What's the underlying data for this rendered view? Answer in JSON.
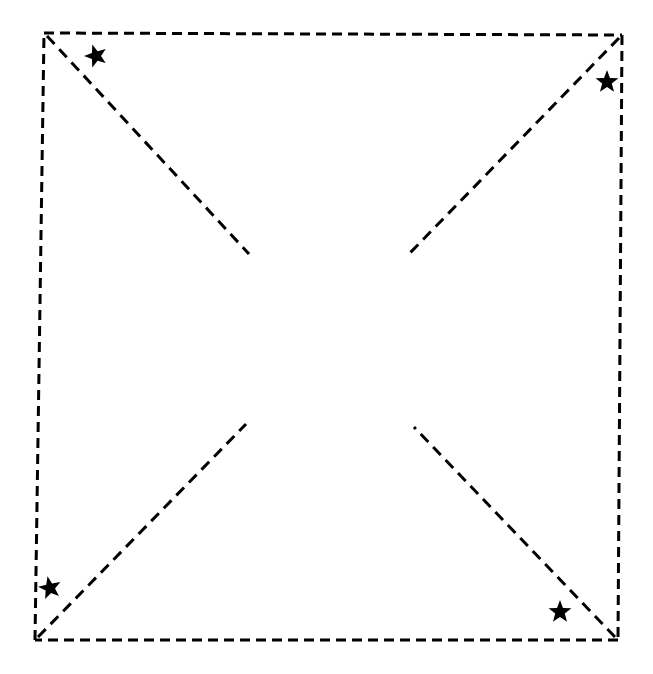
{
  "figure": {
    "canvas": {
      "width": 653,
      "height": 674
    },
    "background_color": "#ffffff",
    "stroke_color": "#000000",
    "marker_color": "#000000",
    "stroke_width": 3,
    "dash_pattern": "10 6",
    "diagonal_dash_pattern": "11 7"
  },
  "square": {
    "name": "dashed-quadrilateral",
    "style": "dashed",
    "corners": {
      "top_left": {
        "label": "top-left-corner",
        "x": 44,
        "y": 33
      },
      "top_right": {
        "label": "top-right-corner",
        "x": 622,
        "y": 35
      },
      "bottom_right": {
        "label": "bottom-right-corner",
        "x": 618,
        "y": 640
      },
      "bottom_left": {
        "label": "bottom-left-corner",
        "x": 35,
        "y": 640
      }
    },
    "edges": [
      {
        "name": "top-edge",
        "from": "top_left",
        "to": "top_right"
      },
      {
        "name": "right-edge",
        "from": "top_right",
        "to": "bottom_right"
      },
      {
        "name": "bottom-edge",
        "from": "bottom_right",
        "to": "bottom_left"
      },
      {
        "name": "left-edge",
        "from": "bottom_left",
        "to": "top_left"
      }
    ]
  },
  "diagonals": [
    {
      "name": "diagonal-from-top-left",
      "style": "dashed",
      "start": {
        "x": 47,
        "y": 36
      },
      "end": {
        "x": 249,
        "y": 254
      }
    },
    {
      "name": "diagonal-from-top-right",
      "style": "dashed",
      "start": {
        "x": 619,
        "y": 38
      },
      "end": {
        "x": 408,
        "y": 255
      }
    },
    {
      "name": "diagonal-from-bottom-left",
      "style": "dashed",
      "start": {
        "x": 38,
        "y": 637
      },
      "end": {
        "x": 246,
        "y": 424
      }
    },
    {
      "name": "diagonal-from-bottom-right",
      "style": "dashed",
      "start": {
        "x": 615,
        "y": 637
      },
      "end": {
        "x": 414,
        "y": 427
      }
    }
  ],
  "stars": [
    {
      "name": "star-marker-top-left",
      "x": 96,
      "y": 56,
      "radius": 12,
      "points": 5,
      "rotation": -18
    },
    {
      "name": "star-marker-top-right",
      "x": 607,
      "y": 82,
      "radius": 12,
      "points": 5,
      "rotation": 0
    },
    {
      "name": "star-marker-bottom-left",
      "x": 50,
      "y": 588,
      "radius": 12,
      "points": 5,
      "rotation": -12
    },
    {
      "name": "star-marker-bottom-right",
      "x": 560,
      "y": 612,
      "radius": 12,
      "points": 5,
      "rotation": 0
    }
  ]
}
